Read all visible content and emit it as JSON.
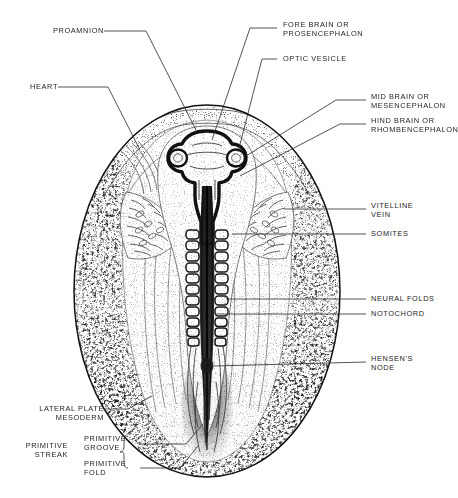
{
  "figure": {
    "background_color": "#ffffff",
    "ink_color": "#1d1d1d"
  },
  "labels": {
    "proamnion": "PROAMNION",
    "heart": "HEART",
    "fore_brain": "FORE BRAIN OR\nPROSENCEPHALON",
    "optic_vesicle": "OPTIC VESICLE",
    "mid_brain": "MID BRAIN OR\nMESENCEPHALON",
    "hind_brain": "HIND BRAIN OR\nRHOMBENCEPHALON",
    "vitelline_vein": "VITELLINE\nVEIN",
    "somites": "SOMITES",
    "neural_folds": "NEURAL FOLDS",
    "notochord": "NOTOCHORD",
    "hensens_node": "HENSEN'S\nNODE",
    "lateral_plate_mesoderm": "LATERAL PLATE\nMESODERM",
    "primitive_streak": "PRIMITIVE\nSTREAK",
    "primitive_groove": "PRIMITIVE\nGROOVE",
    "primitive_fold": "PRIMITIVE\nFOLD"
  },
  "structures": {
    "blastoderm_outline": "oval area pellucida and opaca",
    "neural_tube": "median dark neural tube",
    "somite_count_visible": 11
  }
}
